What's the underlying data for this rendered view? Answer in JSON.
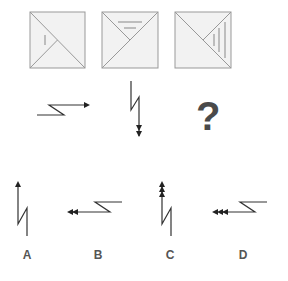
{
  "puzzle": {
    "row1": {
      "squares": [
        {
          "id": "square-1",
          "mark_region": "left-triangle",
          "line_count": 1,
          "line_orientation": "vertical"
        },
        {
          "id": "square-2",
          "mark_region": "top-triangle",
          "line_count": 2,
          "line_orientation": "horizontal"
        },
        {
          "id": "square-3",
          "mark_region": "right-triangle",
          "line_count": 3,
          "line_orientation": "vertical"
        }
      ]
    },
    "row2": {
      "figures": [
        {
          "id": "figure-1",
          "direction": "right",
          "arrowheads": 1
        },
        {
          "id": "figure-2",
          "direction": "down",
          "arrowheads": 2
        }
      ],
      "question_mark": "?"
    },
    "options": [
      {
        "label": "A",
        "direction": "up",
        "arrowheads": 1
      },
      {
        "label": "B",
        "direction": "left",
        "arrowheads": 2
      },
      {
        "label": "C",
        "direction": "up",
        "arrowheads": 3
      },
      {
        "label": "D",
        "direction": "left",
        "arrowheads": 3
      }
    ]
  },
  "colors": {
    "square_fill": "#f2f2f2",
    "square_stroke": "#999999",
    "inner_line": "#888888",
    "figure_stroke": "#333333",
    "label": "#555555",
    "question_mark": "#4a4a4a"
  }
}
